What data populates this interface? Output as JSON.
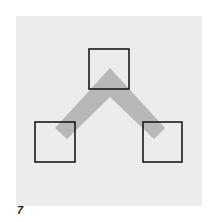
{
  "figure": {
    "label": "7",
    "panel_color": "#ececec",
    "band_color": "#b8b8b8",
    "square_stroke": "#1a1a1a"
  },
  "diagram": {
    "nodes": [
      {
        "id": "top-square",
        "x": 89,
        "y": 49,
        "size": 40
      },
      {
        "id": "left-square",
        "x": 35,
        "y": 122,
        "size": 40
      },
      {
        "id": "right-square",
        "x": 143,
        "y": 122,
        "size": 39
      }
    ],
    "connector": {
      "shape": "chevron",
      "apex": [
        110,
        68
      ],
      "left_end": [
        61,
        133
      ],
      "right_end": [
        159,
        133
      ],
      "thickness": 18
    }
  }
}
